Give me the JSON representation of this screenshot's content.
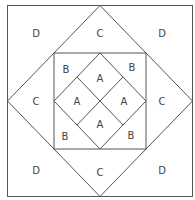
{
  "diagram": {
    "stroke_color": "#555555",
    "labels": [
      {
        "text": "D",
        "x": 36,
        "y": 33
      },
      {
        "text": "C",
        "x": 100,
        "y": 33
      },
      {
        "text": "D",
        "x": 162,
        "y": 33
      },
      {
        "text": "B",
        "x": 66,
        "y": 69
      },
      {
        "text": "A",
        "x": 100,
        "y": 78
      },
      {
        "text": "B",
        "x": 132,
        "y": 67
      },
      {
        "text": "C",
        "x": 36,
        "y": 101
      },
      {
        "text": "A",
        "x": 77,
        "y": 101
      },
      {
        "text": "A",
        "x": 124,
        "y": 101
      },
      {
        "text": "C",
        "x": 162,
        "y": 101
      },
      {
        "text": "A",
        "x": 100,
        "y": 124
      },
      {
        "text": "B",
        "x": 65,
        "y": 136
      },
      {
        "text": "B",
        "x": 131,
        "y": 135
      },
      {
        "text": "D",
        "x": 36,
        "y": 170
      },
      {
        "text": "C",
        "x": 100,
        "y": 172
      },
      {
        "text": "D",
        "x": 162,
        "y": 170
      }
    ]
  }
}
